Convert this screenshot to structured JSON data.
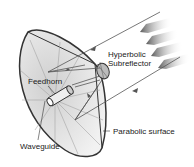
{
  "diagram": {
    "labels": {
      "subreflector_line1": "Hyperbolic",
      "subreflector_line2": "Subreflector",
      "feedhorn": "Feedhorn",
      "parabolic": "Parabolic surface",
      "waveguide": "Waveguide"
    },
    "colors": {
      "dish_fill": "#e4e4e4",
      "dish_outline": "#333333",
      "ray": "#555555",
      "arrow_band": "#707070"
    }
  }
}
